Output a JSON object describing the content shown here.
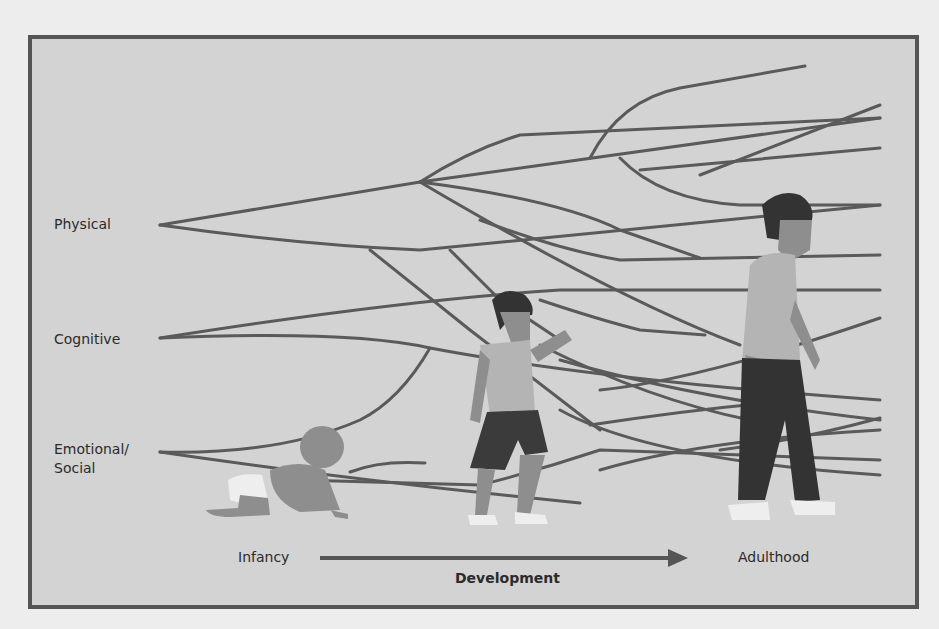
{
  "diagram": {
    "domains": [
      {
        "label": "Physical"
      },
      {
        "label": "Cognitive"
      },
      {
        "label": "Emotional/\nSocial",
        "line1": "Emotional/",
        "line2": "Social"
      }
    ],
    "axis": {
      "start_label": "Infancy",
      "end_label": "Adulthood",
      "caption": "Development"
    },
    "figures": [
      "crawling infant",
      "walking child",
      "walking adult"
    ],
    "colors": {
      "page_background": "#ededed",
      "panel_background": "#d3d3d3",
      "frame_border": "#555555",
      "branch_lines": "#5a5a5a",
      "text": "#2b2b2b"
    }
  }
}
